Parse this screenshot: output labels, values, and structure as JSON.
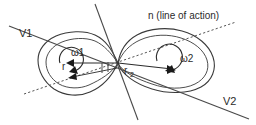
{
  "figure": {
    "background_color": "#ffffff",
    "stroke_color": "#3a3a3a",
    "text_color": "#2b2b2b",
    "width": 256,
    "height": 125
  },
  "labels": {
    "v1": "V1",
    "v2": "V2",
    "normal_line": "n (line of action)",
    "omega1": "ω1",
    "omega2": "ω2",
    "r1": "r",
    "r2_base": "r",
    "r2_sub": "2"
  },
  "elements": {
    "body1_name": "left-body-outline",
    "body2_name": "right-body-outline",
    "contact_point": {
      "x": 118,
      "y": 63
    },
    "body1_center": {
      "x": 72,
      "y": 62
    },
    "body2_center": {
      "x": 172,
      "y": 61
    }
  },
  "geometry": {
    "v_line": {
      "x1": 9,
      "y1": 26,
      "x2": 249,
      "y2": 119
    },
    "steep_line": {
      "x1": 95,
      "y1": 4,
      "x2": 138,
      "y2": 120
    },
    "dotted_line": {
      "x1": 24,
      "y1": 94,
      "x2": 236,
      "y2": 22
    },
    "tick_marks": [
      {
        "x": 102,
        "y1": 63,
        "y2": 73
      },
      {
        "x": 108,
        "y1": 62,
        "y2": 72
      }
    ]
  }
}
